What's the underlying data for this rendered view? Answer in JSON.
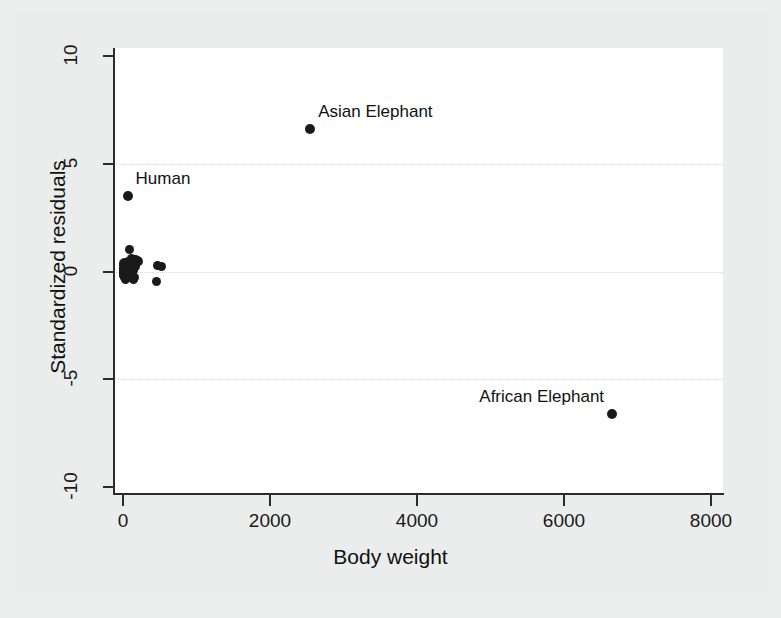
{
  "chart_data": {
    "type": "scatter",
    "title": "",
    "xlabel": "Body weight",
    "ylabel": "Standardized residuals",
    "xlim": [
      -200,
      8200
    ],
    "ylim": [
      -10.6,
      10.6
    ],
    "xticks": [
      0,
      2000,
      4000,
      6000,
      8000
    ],
    "xticklabels": [
      "0",
      "2000",
      "4000",
      "6000",
      "8000"
    ],
    "yticks": [
      10,
      5,
      0,
      -5,
      -10
    ],
    "yticklabels": [
      "10",
      "5",
      "0",
      "-5",
      "-10"
    ],
    "grid": "horizontal-dotted",
    "gridlines_y": [
      5,
      0,
      -5
    ],
    "legend": "none",
    "marker": {
      "shape": "circle",
      "color": "#1a1a1a",
      "size": 9
    },
    "annotations": [
      {
        "text": "Asian Elephant",
        "x": 2547,
        "y": 6.6,
        "placement": "right-above"
      },
      {
        "text": "Human",
        "x": 62,
        "y": 3.5,
        "placement": "right-above"
      },
      {
        "text": "African Elephant",
        "x": 6654,
        "y": -6.6,
        "placement": "left-above"
      }
    ],
    "points": [
      {
        "x": 2547,
        "y": 6.6,
        "label": "Asian Elephant"
      },
      {
        "x": 62,
        "y": 3.5,
        "label": "Human"
      },
      {
        "x": 6654,
        "y": -6.6,
        "label": "African Elephant"
      },
      {
        "x": 87,
        "y": 1.0,
        "label": ""
      },
      {
        "x": 120,
        "y": 0.6,
        "label": ""
      },
      {
        "x": 165,
        "y": 0.55,
        "label": ""
      },
      {
        "x": 192,
        "y": 0.5,
        "label": ""
      },
      {
        "x": 207,
        "y": 0.45,
        "label": ""
      },
      {
        "x": 465,
        "y": 0.3,
        "label": ""
      },
      {
        "x": 529,
        "y": 0.25,
        "label": ""
      },
      {
        "x": 460,
        "y": -0.45,
        "label": ""
      },
      {
        "x": 10,
        "y": 0.35,
        "label": ""
      },
      {
        "x": 15,
        "y": 0.2,
        "label": ""
      },
      {
        "x": 25,
        "y": 0.15,
        "label": ""
      },
      {
        "x": 35,
        "y": 0.1,
        "label": ""
      },
      {
        "x": 45,
        "y": 0.05,
        "label": ""
      },
      {
        "x": 55,
        "y": 0.0,
        "label": ""
      },
      {
        "x": 5,
        "y": 0.0,
        "label": ""
      },
      {
        "x": 8,
        "y": -0.1,
        "label": ""
      },
      {
        "x": 12,
        "y": -0.2,
        "label": ""
      },
      {
        "x": 20,
        "y": -0.3,
        "label": ""
      },
      {
        "x": 30,
        "y": -0.35,
        "label": ""
      },
      {
        "x": 48,
        "y": -0.3,
        "label": ""
      },
      {
        "x": 70,
        "y": -0.25,
        "label": ""
      },
      {
        "x": 95,
        "y": -0.2,
        "label": ""
      },
      {
        "x": 110,
        "y": -0.3,
        "label": ""
      },
      {
        "x": 140,
        "y": -0.35,
        "label": ""
      },
      {
        "x": 160,
        "y": -0.3,
        "label": ""
      },
      {
        "x": 3,
        "y": 0.15,
        "label": ""
      },
      {
        "x": 6,
        "y": 0.3,
        "label": ""
      },
      {
        "x": 18,
        "y": 0.4,
        "label": ""
      },
      {
        "x": 40,
        "y": 0.35,
        "label": ""
      },
      {
        "x": 75,
        "y": 0.45,
        "label": ""
      },
      {
        "x": 100,
        "y": 0.5,
        "label": ""
      },
      {
        "x": 130,
        "y": 0.4,
        "label": ""
      },
      {
        "x": 175,
        "y": 0.25,
        "label": ""
      },
      {
        "x": 2,
        "y": -0.05,
        "label": ""
      },
      {
        "x": 4,
        "y": 0.05,
        "label": ""
      },
      {
        "x": 1,
        "y": 0.1,
        "label": ""
      },
      {
        "x": 60,
        "y": 0.2,
        "label": ""
      },
      {
        "x": 85,
        "y": 0.1,
        "label": ""
      },
      {
        "x": 115,
        "y": 0.15,
        "label": ""
      },
      {
        "x": 145,
        "y": 0.05,
        "label": ""
      },
      {
        "x": 22,
        "y": -0.15,
        "label": ""
      },
      {
        "x": 52,
        "y": -0.1,
        "label": ""
      }
    ]
  },
  "axis": {
    "xlabel": "Body weight",
    "ylabel": "Standardized residuals"
  },
  "colors": {
    "background": "#ebecec",
    "plot_background": "#ffffff",
    "marker": "#1a1a1a",
    "axis": "#2b2b2b",
    "grid": "#d9d9d9",
    "text": "#111111"
  }
}
